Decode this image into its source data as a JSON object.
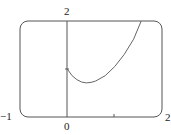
{
  "chart_data": {
    "type": "line",
    "title": "",
    "xlabel": "",
    "ylabel": "",
    "xlim": [
      -1,
      2
    ],
    "ylim": [
      0,
      2
    ],
    "grid": false,
    "tick_labels": {
      "x": [
        "-1",
        "0",
        "2"
      ],
      "y": [
        "2"
      ]
    },
    "series": [
      {
        "name": "f(x)",
        "x": [
          0,
          0.1,
          0.2,
          0.3,
          0.4,
          0.5,
          0.6,
          0.8,
          1.0,
          1.2,
          1.4,
          1.56
        ],
        "y": [
          1.0,
          0.86,
          0.78,
          0.73,
          0.71,
          0.72,
          0.75,
          0.86,
          1.05,
          1.3,
          1.62,
          2.0
        ]
      }
    ]
  },
  "labels": {
    "x_min": "−1",
    "x_zero": "0",
    "x_max": "2",
    "y_max": "2"
  }
}
